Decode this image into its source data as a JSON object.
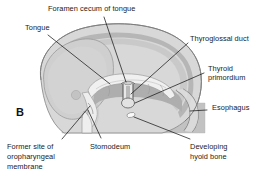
{
  "figure": {
    "panel_letter": "B",
    "type": "anatomical-illustration",
    "background_color": "#ffffff",
    "line_color": "#1a1a1a",
    "palette": {
      "outer_tissue": "#d6d6d6",
      "mid_tissue": "#c0c0c0",
      "dark_tissue": "#a8a8a8",
      "pharynx_cavity": "#b4b4b4",
      "epithelium_light": "#efefef",
      "highlight_white": "#fbfbfb"
    }
  },
  "labels": [
    {
      "id": "foramen-cecum",
      "text": "Foramen cecum of tongue"
    },
    {
      "id": "tongue",
      "text": "Tongue"
    },
    {
      "id": "thyroglossal-duct",
      "text": "Thyroglossal duct"
    },
    {
      "id": "thyroid-primordium-line1",
      "text": "Thyroid"
    },
    {
      "id": "thyroid-primordium-line2",
      "text": "primordium"
    },
    {
      "id": "esophagus",
      "text": "Esophagus"
    },
    {
      "id": "former-site-line1",
      "text": "Former site of"
    },
    {
      "id": "former-site-line2",
      "text": "oropharyngeal"
    },
    {
      "id": "former-site-line3",
      "text": "membrane"
    },
    {
      "id": "stomodeum",
      "text": "Stomodeum"
    },
    {
      "id": "hyoid-line1",
      "text": "Developing"
    },
    {
      "id": "hyoid-line2",
      "text": "hyoid bone"
    }
  ],
  "label_text": {
    "foramen_cecum": "Foramen cecum of tongue",
    "tongue": "Tongue",
    "thyroglossal_duct": "Thyroglossal duct",
    "thyroid_primordium_1": "Thyroid",
    "thyroid_primordium_2": "primordium",
    "esophagus": "Esophagus",
    "former_site_1": "Former site of",
    "former_site_2": "oropharyngeal",
    "former_site_3": "membrane",
    "stomodeum": "Stomodeum",
    "hyoid_1": "Developing",
    "hyoid_2": "hyoid bone",
    "panel": "B"
  }
}
